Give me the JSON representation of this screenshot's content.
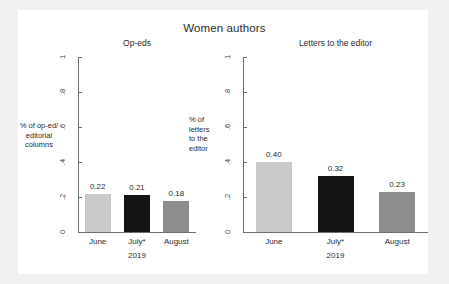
{
  "chart_data": {
    "type": "bar",
    "title": "Women authors",
    "categories": [
      "June",
      "July*",
      "August"
    ],
    "xlabel": "2019",
    "ylim": [
      0,
      1
    ],
    "yticks": [
      "0",
      ".2",
      ".4",
      ".6",
      ".8",
      "1"
    ],
    "ytick_values": [
      0,
      0.2,
      0.4,
      0.6,
      0.8,
      1
    ],
    "grid": false,
    "legend": "none",
    "panels": [
      {
        "title": "Op-eds",
        "ylabel": "% of op-ed/\neditorial\ncolumns",
        "ylabel_lines": [
          "% of op-ed/",
          "editorial",
          "columns"
        ],
        "values": [
          0.22,
          0.21,
          0.18
        ],
        "labels": [
          "0.22",
          "0.21",
          "0.18"
        ],
        "colors": [
          "#c9c9c9",
          "#141414",
          "#8d8d8d"
        ]
      },
      {
        "title": "Letters to the editor",
        "ylabel": "% of\nletters\nto the\neditor",
        "ylabel_lines": [
          "% of",
          "letters",
          "to the",
          "editor"
        ],
        "values": [
          0.4,
          0.32,
          0.23
        ],
        "labels": [
          "0.40",
          "0.32",
          "0.23"
        ],
        "colors": [
          "#c9c9c9",
          "#141414",
          "#8d8d8d"
        ]
      }
    ]
  },
  "colors": {
    "page_background": "#f2f1ef",
    "figure_background": "#ffffff",
    "axis": "#6f6f6f",
    "text": "#2b2b2b",
    "bar_light": "#c9c9c9",
    "bar_black": "#141414",
    "bar_gray": "#8d8d8d"
  }
}
